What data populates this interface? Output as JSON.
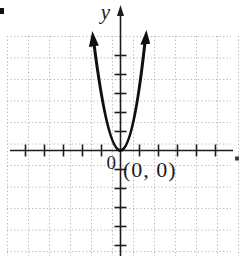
{
  "figure": {
    "y_axis_label": "y",
    "origin_label": "0",
    "point_label": "(0, 0)"
  },
  "colors": {
    "background": "#ffffff",
    "axis": "#1c1c1c",
    "grid": "#b4b4b4",
    "curve": "#101010",
    "text": "#1c1c1c"
  },
  "chart_data": {
    "type": "line",
    "title": "",
    "xlabel": "",
    "ylabel": "y",
    "grid": true,
    "legend": "none",
    "x_range_ticks": [
      -5,
      5
    ],
    "y_range_ticks": [
      -5,
      5
    ],
    "tick_interval": 1,
    "vertex": [
      0,
      0
    ],
    "vertex_label": "(0, 0)",
    "origin_label": "0",
    "series": [
      {
        "name": "parabola",
        "description": "upward-opening parabola with vertex at the origin, drawn with arrowed ends",
        "x": [
          -1.4,
          -1.0,
          -0.6,
          -0.3,
          0,
          0.3,
          0.6,
          1.0,
          1.4
        ],
        "values": [
          5.6,
          2.9,
          1.0,
          0.26,
          0,
          0.26,
          1.0,
          2.9,
          5.6
        ]
      }
    ],
    "annotations": [
      {
        "text": "0",
        "at": [
          0,
          0
        ],
        "position": "below-left-of-origin"
      },
      {
        "text": "(0, 0)",
        "at": [
          0,
          0
        ],
        "position": "below-right-of-origin"
      }
    ]
  }
}
